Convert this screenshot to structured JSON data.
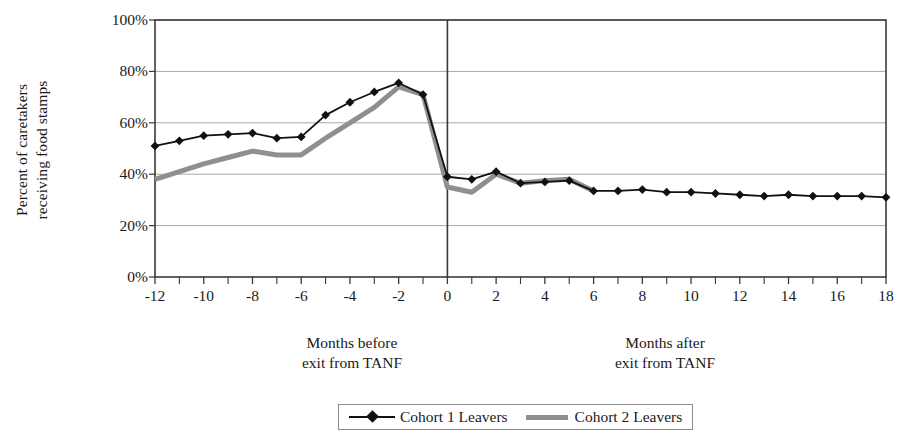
{
  "chart_data": {
    "type": "line",
    "title": "",
    "ylabel": "Percent of caretakers receiving food stamps",
    "ylabel_lines": [
      "Percent of caretakers",
      "receiving food stamps"
    ],
    "xlabel_before": "Months before exit from TANF",
    "xlabel_after": "Months after exit from TANF",
    "xlabel_before_lines": [
      "Months before",
      "exit from TANF"
    ],
    "xlabel_after_lines": [
      "Months after",
      "exit from TANF"
    ],
    "x": [
      -12,
      -11,
      -10,
      -9,
      -8,
      -7,
      -6,
      -5,
      -4,
      -3,
      -2,
      -1,
      0,
      1,
      2,
      3,
      4,
      5,
      6,
      7,
      8,
      9,
      10,
      11,
      12,
      13,
      14,
      15,
      16,
      17,
      18
    ],
    "xlim": [
      -12,
      18
    ],
    "ylim": [
      0,
      100
    ],
    "ytick_labels": [
      "0%",
      "20%",
      "40%",
      "60%",
      "80%",
      "100%"
    ],
    "ytick_values": [
      0,
      20,
      40,
      60,
      80,
      100
    ],
    "xtick_labels": [
      "-12",
      "-10",
      "-8",
      "-6",
      "-4",
      "-2",
      "0",
      "2",
      "4",
      "6",
      "8",
      "10",
      "12",
      "14",
      "16",
      "18"
    ],
    "xtick_values": [
      -12,
      -10,
      -8,
      -6,
      -4,
      -2,
      0,
      2,
      4,
      6,
      8,
      10,
      12,
      14,
      16,
      18
    ],
    "grid": "horizontal",
    "legend_position": "bottom",
    "divider_x": 0,
    "series": [
      {
        "name": "Cohort 1 Leavers",
        "color": "#111111",
        "marker": "diamond",
        "x": [
          -12,
          -11,
          -10,
          -9,
          -8,
          -7,
          -6,
          -5,
          -4,
          -3,
          -2,
          -1,
          0,
          1,
          2,
          3,
          4,
          5,
          6,
          7,
          8,
          9,
          10,
          11,
          12,
          13,
          14,
          15,
          16,
          17,
          18
        ],
        "values": [
          51,
          53,
          55,
          55.5,
          56,
          54,
          54.5,
          63,
          68,
          72,
          75.5,
          71,
          39,
          38,
          41,
          36.5,
          37,
          37.5,
          33.5,
          33.5,
          34,
          33,
          33,
          32.5,
          32,
          31.5,
          32,
          31.5,
          31.5,
          31.5,
          31
        ]
      },
      {
        "name": "Cohort 2 Leavers",
        "color": "#8f8f8f",
        "marker": "none",
        "x": [
          -12,
          -11,
          -10,
          -9,
          -8,
          -7,
          -6,
          -5,
          -4,
          -3,
          -2,
          -1,
          0,
          1,
          2,
          3,
          4,
          5,
          6
        ],
        "values": [
          38,
          41,
          44,
          46.5,
          49,
          47.5,
          47.5,
          54,
          60,
          66,
          74,
          71,
          35,
          33,
          40,
          36.5,
          37.5,
          38,
          33.5
        ]
      }
    ]
  },
  "legend": {
    "entries": [
      {
        "label": "Cohort 1 Leavers",
        "style": "black-diamond-line"
      },
      {
        "label": "Cohort 2 Leavers",
        "style": "gray-thick-line"
      }
    ]
  }
}
